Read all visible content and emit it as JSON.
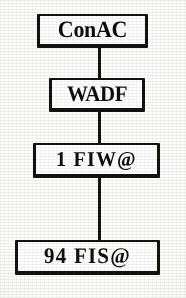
{
  "document": {
    "kind": "scanned-organization-chart",
    "orientation": "vertical-chain",
    "ink_color": "#15120e",
    "paper_color": "#fdfdfb"
  },
  "chart": {
    "nodes": [
      {
        "id": "conac",
        "label": "ConAC"
      },
      {
        "id": "wadf",
        "label": "WADF"
      },
      {
        "id": "fiw",
        "label": "1 FIW@"
      },
      {
        "id": "fis",
        "label": "94 FIS@"
      }
    ],
    "connectors": [
      {
        "id": "conn-1",
        "from": "conac",
        "to": "wadf"
      },
      {
        "id": "conn-2",
        "from": "wadf",
        "to": "fiw"
      },
      {
        "id": "conn-3",
        "from": "fiw",
        "to": "fis"
      }
    ]
  }
}
